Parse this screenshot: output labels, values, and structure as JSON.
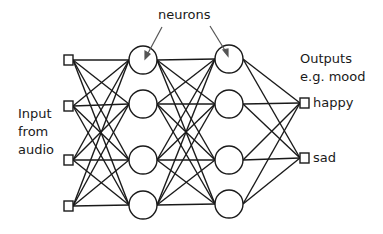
{
  "labels": {
    "neurons": "neurons",
    "input_line1": "Input",
    "input_line2": "from",
    "input_line3": "audio",
    "outputs_line1": "Outputs",
    "outputs_line2": "e.g. mood",
    "output_happy": "happy",
    "output_sad": "sad"
  },
  "diagram": {
    "type": "feedforward-neural-network",
    "layers": [
      {
        "name": "input",
        "shape": "square",
        "count": 4
      },
      {
        "name": "hidden-1",
        "shape": "circle",
        "count": 4
      },
      {
        "name": "hidden-2",
        "shape": "circle",
        "count": 4
      },
      {
        "name": "output",
        "shape": "square",
        "count": 2
      }
    ],
    "connections": "fully-connected",
    "stroke_color": "#1a1a1a"
  }
}
